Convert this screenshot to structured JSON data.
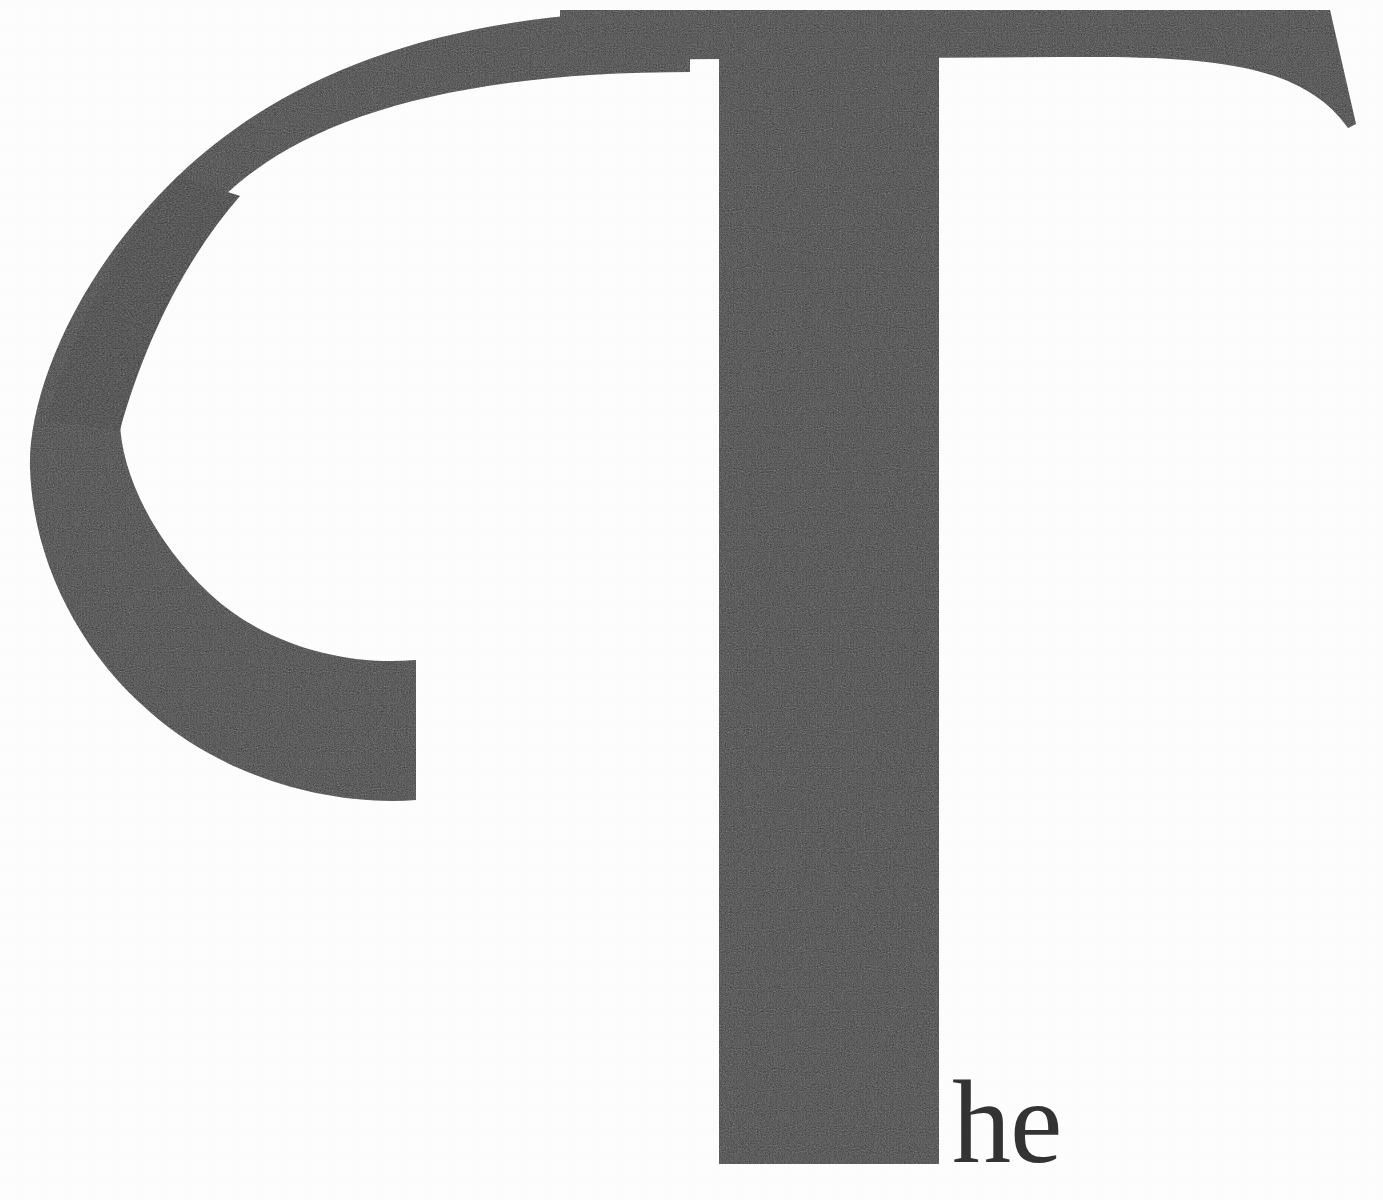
{
  "page": {
    "kind": "decorative-drop-cap-chapter-opener",
    "width": 1383,
    "height": 1200,
    "background_color": "#fefefe",
    "ink_color": "#363636"
  },
  "dropcap": {
    "letter": "T",
    "ornament_letter": "C",
    "ink_color": "#363636",
    "description_label": "ornamental capital T inside open C swash"
  },
  "text": {
    "continuation": "he",
    "full_word": "The",
    "color": "#333333",
    "font_size_px": 118
  },
  "geometry": {
    "crossbar": {
      "left_x": 0,
      "right_x": 1356,
      "top_y": 10,
      "bottom_y": 60,
      "right_terminal_tip_y": 128
    },
    "stem": {
      "left_x": 718,
      "right_x": 940,
      "top_y": 60,
      "bottom_y": 1164
    },
    "swash_c": {
      "leftmost_x": 28,
      "arc_top_y": 12,
      "arc_bottom_y": 692,
      "terminal_x": 416,
      "stroke_thin_px": 48,
      "stroke_thick_px": 80
    },
    "he_text": {
      "left_x": 958,
      "baseline_y": 1168,
      "ascender_y": 1098
    }
  },
  "chart_data": {
    "type": "table",
    "categories": [
      "swash C",
      "capital T crossbar",
      "capital T stem",
      "lowercase he"
    ],
    "values": [
      692,
      1356,
      1104,
      70
    ]
  }
}
